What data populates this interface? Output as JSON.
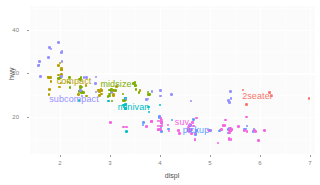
{
  "chart_data": {
    "type": "scatter",
    "title": "",
    "xlabel": "displ",
    "ylabel": "hwy",
    "xlim": [
      1.4,
      7.1
    ],
    "ylim": [
      11.5,
      45.5
    ],
    "xticks": [
      "2",
      "3",
      "4",
      "5",
      "6",
      "7"
    ],
    "xtick_values": [
      2,
      3,
      4,
      5,
      6,
      7
    ],
    "yticks": [
      "20",
      "30",
      "40"
    ],
    "ytick_values": [
      20,
      30,
      40
    ],
    "grid": true,
    "legend_position": "none",
    "annotations": [
      {
        "label": "2seater",
        "x": 5.95,
        "y": 24.8,
        "color": "#f8766d"
      },
      {
        "label": "compact",
        "x": 2.28,
        "y": 28.2,
        "color": "#b79f00"
      },
      {
        "label": "midsize",
        "x": 3.12,
        "y": 27.6,
        "color": "#7cae00"
      },
      {
        "label": "minivan",
        "x": 3.47,
        "y": 22.4,
        "color": "#00bfc4"
      },
      {
        "label": "pickup",
        "x": 4.72,
        "y": 16.9,
        "color": "#619cff"
      },
      {
        "label": "subcompact",
        "x": 2.28,
        "y": 24.2,
        "color": "#9590ff"
      },
      {
        "label": "suv",
        "x": 4.44,
        "y": 18.8,
        "color": "#f564e3"
      }
    ],
    "class_colors": {
      "2seater": "#f8766d",
      "compact": "#b79f00",
      "midsize": "#7cae00",
      "minivan": "#00bfc4",
      "pickup": "#619cff",
      "subcompact": "#9590ff",
      "suv": "#f564e3"
    },
    "series": [
      {
        "name": "2seater",
        "color": "#f8766d",
        "points": [
          [
            5.7,
            26
          ],
          [
            5.7,
            23
          ],
          [
            6.2,
            26
          ],
          [
            6.2,
            25
          ],
          [
            7.0,
            24
          ]
        ]
      },
      {
        "name": "compact",
        "color": "#b79f00",
        "points": [
          [
            1.8,
            29
          ],
          [
            1.8,
            29
          ],
          [
            2.0,
            31
          ],
          [
            2.0,
            30
          ],
          [
            2.8,
            26
          ],
          [
            2.8,
            26
          ],
          [
            3.1,
            27
          ],
          [
            1.8,
            26
          ],
          [
            1.8,
            25
          ],
          [
            2.0,
            28
          ],
          [
            2.0,
            27
          ],
          [
            2.8,
            25
          ],
          [
            2.8,
            25
          ],
          [
            3.1,
            25
          ],
          [
            3.1,
            25
          ],
          [
            2.4,
            27
          ],
          [
            2.4,
            25
          ],
          [
            2.5,
            27
          ],
          [
            2.5,
            25
          ],
          [
            3.3,
            24
          ],
          [
            2.0,
            31
          ],
          [
            2.0,
            30
          ],
          [
            2.0,
            31
          ],
          [
            2.0,
            31
          ],
          [
            2.8,
            26
          ],
          [
            2.8,
            26
          ],
          [
            3.6,
            26
          ],
          [
            1.8,
            28
          ],
          [
            1.8,
            29
          ],
          [
            2.0,
            32
          ],
          [
            2.0,
            32
          ],
          [
            2.8,
            26
          ],
          [
            2.8,
            26
          ],
          [
            3.1,
            26
          ]
        ]
      },
      {
        "name": "midsize",
        "color": "#7cae00",
        "points": [
          [
            2.4,
            26
          ],
          [
            3.0,
            24
          ],
          [
            3.5,
            27
          ],
          [
            2.4,
            26
          ],
          [
            3.0,
            25
          ],
          [
            3.3,
            24
          ],
          [
            3.8,
            25
          ],
          [
            2.4,
            29
          ],
          [
            2.4,
            27
          ],
          [
            3.1,
            26
          ],
          [
            3.5,
            28
          ],
          [
            2.4,
            27
          ],
          [
            3.0,
            26
          ],
          [
            3.5,
            28
          ],
          [
            2.2,
            28
          ],
          [
            2.2,
            27
          ],
          [
            2.4,
            26
          ],
          [
            2.4,
            26
          ],
          [
            3.0,
            26
          ],
          [
            3.0,
            26
          ],
          [
            3.5,
            26
          ],
          [
            2.2,
            29
          ],
          [
            2.2,
            28
          ],
          [
            2.4,
            27
          ],
          [
            2.4,
            26
          ],
          [
            3.0,
            25
          ],
          [
            3.3,
            25
          ],
          [
            3.8,
            25
          ],
          [
            2.0,
            29
          ],
          [
            2.0,
            29
          ],
          [
            2.4,
            29
          ],
          [
            2.4,
            29
          ],
          [
            3.5,
            27
          ],
          [
            3.6,
            26
          ],
          [
            3.0,
            25
          ],
          [
            3.3,
            24
          ],
          [
            3.8,
            26
          ],
          [
            2.5,
            26
          ]
        ]
      },
      {
        "name": "minivan",
        "color": "#00bfc4",
        "points": [
          [
            2.4,
            24
          ],
          [
            3.0,
            24
          ],
          [
            3.3,
            22
          ],
          [
            3.3,
            22
          ],
          [
            3.3,
            24
          ],
          [
            3.3,
            24
          ],
          [
            3.3,
            17
          ],
          [
            3.8,
            22
          ],
          [
            3.8,
            21
          ],
          [
            4.0,
            23
          ],
          [
            3.3,
            23
          ],
          [
            3.3,
            23
          ]
        ]
      },
      {
        "name": "pickup",
        "color": "#619cff",
        "points": [
          [
            4.7,
            19
          ],
          [
            5.7,
            17
          ],
          [
            5.9,
            17
          ],
          [
            4.7,
            16
          ],
          [
            5.2,
            17
          ],
          [
            5.7,
            17
          ],
          [
            4.7,
            17
          ],
          [
            4.7,
            16
          ],
          [
            5.2,
            17
          ],
          [
            5.7,
            18
          ],
          [
            5.9,
            17
          ],
          [
            4.0,
            20
          ],
          [
            4.0,
            19
          ],
          [
            4.6,
            18
          ],
          [
            5.0,
            17
          ],
          [
            4.2,
            19
          ],
          [
            4.2,
            17
          ],
          [
            4.6,
            17
          ],
          [
            4.6,
            18
          ],
          [
            4.6,
            17
          ],
          [
            5.4,
            17
          ],
          [
            5.4,
            17
          ],
          [
            4.0,
            20
          ],
          [
            4.0,
            19
          ],
          [
            4.6,
            18
          ],
          [
            4.6,
            17
          ],
          [
            5.4,
            17
          ],
          [
            5.4,
            16
          ],
          [
            3.7,
            19
          ],
          [
            3.7,
            18
          ],
          [
            4.0,
            18
          ],
          [
            4.0,
            17
          ],
          [
            4.7,
            17
          ]
        ]
      },
      {
        "name": "subcompact",
        "color": "#9590ff",
        "points": [
          [
            1.6,
            33
          ],
          [
            1.6,
            32
          ],
          [
            1.6,
            32
          ],
          [
            1.6,
            29
          ],
          [
            1.6,
            32
          ],
          [
            1.8,
            34
          ],
          [
            1.8,
            36
          ],
          [
            1.8,
            36
          ],
          [
            2.0,
            29
          ],
          [
            2.4,
            26
          ],
          [
            2.4,
            25
          ],
          [
            2.5,
            29
          ],
          [
            2.5,
            29
          ],
          [
            3.3,
            24
          ],
          [
            2.0,
            33
          ],
          [
            2.0,
            35
          ],
          [
            2.0,
            37
          ],
          [
            2.0,
            35
          ],
          [
            2.7,
            28
          ],
          [
            2.7,
            26
          ],
          [
            2.7,
            29
          ],
          [
            3.0,
            26
          ],
          [
            3.7,
            24
          ],
          [
            4.0,
            25
          ],
          [
            5.4,
            26
          ],
          [
            5.4,
            23
          ],
          [
            5.4,
            24
          ],
          [
            4.0,
            26
          ],
          [
            4.2,
            25
          ],
          [
            4.6,
            24
          ],
          [
            5.4,
            24
          ],
          [
            3.8,
            24
          ],
          [
            3.8,
            26
          ]
        ]
      },
      {
        "name": "suv",
        "color": "#f564e3",
        "points": [
          [
            4.0,
            17
          ],
          [
            4.0,
            17
          ],
          [
            4.6,
            16
          ],
          [
            5.0,
            17
          ],
          [
            4.2,
            17
          ],
          [
            4.4,
            16
          ],
          [
            4.6,
            17
          ],
          [
            5.4,
            15
          ],
          [
            5.4,
            15
          ],
          [
            4.0,
            19
          ],
          [
            4.0,
            17
          ],
          [
            4.6,
            17
          ],
          [
            4.6,
            17
          ],
          [
            4.6,
            18
          ],
          [
            4.6,
            17
          ],
          [
            4.6,
            19
          ],
          [
            5.4,
            17
          ],
          [
            5.4,
            15
          ],
          [
            5.4,
            17
          ],
          [
            4.7,
            15
          ],
          [
            4.7,
            15
          ],
          [
            4.7,
            16
          ],
          [
            5.2,
            14
          ],
          [
            5.2,
            17
          ],
          [
            5.7,
            17
          ],
          [
            5.9,
            17
          ],
          [
            4.6,
            17
          ],
          [
            5.4,
            17
          ],
          [
            4.0,
            18
          ],
          [
            4.0,
            18
          ],
          [
            4.6,
            18
          ],
          [
            4.6,
            17
          ],
          [
            5.4,
            17
          ],
          [
            4.0,
            19
          ],
          [
            4.0,
            20
          ],
          [
            4.0,
            18
          ],
          [
            4.0,
            17
          ],
          [
            4.6,
            18
          ],
          [
            5.0,
            17
          ],
          [
            3.0,
            19
          ],
          [
            3.7,
            18
          ],
          [
            4.0,
            20
          ],
          [
            4.7,
            18
          ],
          [
            4.7,
            20
          ],
          [
            4.7,
            19
          ],
          [
            5.7,
            20
          ],
          [
            6.1,
            17
          ],
          [
            4.0,
            19
          ],
          [
            4.2,
            18
          ],
          [
            4.4,
            17
          ],
          [
            4.6,
            17
          ],
          [
            5.4,
            16
          ],
          [
            5.4,
            17
          ],
          [
            3.3,
            18
          ],
          [
            3.3,
            18
          ],
          [
            4.0,
            19
          ],
          [
            5.6,
            18
          ],
          [
            3.8,
            19
          ],
          [
            3.8,
            19
          ],
          [
            4.0,
            18
          ],
          [
            5.3,
            18
          ],
          [
            5.3,
            18
          ],
          [
            5.3,
            19
          ],
          [
            5.7,
            17
          ],
          [
            6.0,
            15
          ],
          [
            5.9,
            17
          ],
          [
            4.6,
            17
          ],
          [
            5.4,
            17
          ]
        ]
      }
    ]
  }
}
